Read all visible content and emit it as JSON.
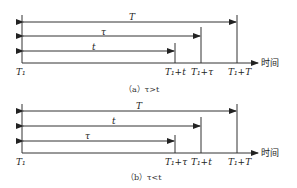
{
  "panels": [
    {
      "id": "a",
      "caption": "（a）τ>t",
      "origin_label": "T₁",
      "axis_label": "时间",
      "arrows": [
        {
          "label": "T",
          "end_label": "T₁+T"
        },
        {
          "label": "τ",
          "end_label": "T₁+τ"
        },
        {
          "label": "t",
          "end_label": "T₁+t"
        }
      ],
      "tick_labels": [
        "T₁+t",
        "T₁+τ",
        "T₁+T"
      ]
    },
    {
      "id": "b",
      "caption": "（b）τ<t",
      "origin_label": "T₁",
      "axis_label": "时间",
      "arrows": [
        {
          "label": "T",
          "end_label": "T₁+T"
        },
        {
          "label": "t",
          "end_label": "T₁+t"
        },
        {
          "label": "τ",
          "end_label": "T₁+τ"
        }
      ],
      "tick_labels": [
        "T₁+τ",
        "T₁+t",
        "T₁+T"
      ]
    }
  ]
}
